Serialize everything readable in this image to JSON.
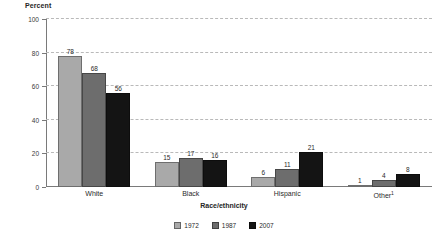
{
  "chart_data": {
    "type": "bar",
    "title": "",
    "subtitle": "",
    "xlabel": "Race/ethnicity",
    "ylabel": "Percent",
    "categories": [
      "White",
      "Black",
      "Hispanic",
      "Other"
    ],
    "category_footnotes": [
      "",
      "",
      "",
      "1"
    ],
    "series": [
      {
        "name": "1972",
        "color": "#a9a9a9",
        "values": [
          78,
          15,
          6,
          1
        ]
      },
      {
        "name": "1987",
        "color": "#6d6d6d",
        "values": [
          68,
          17,
          11,
          4
        ]
      },
      {
        "name": "2007",
        "color": "#141414",
        "values": [
          56,
          16,
          21,
          8
        ]
      }
    ],
    "ylim": [
      0,
      100
    ],
    "yticks": [
      0,
      20,
      40,
      60,
      80,
      100
    ],
    "ytick_labels": [
      "0",
      "20",
      "40",
      "60",
      "80",
      "100"
    ],
    "grid": "horizontal-dashed",
    "legend_position": "bottom-center"
  },
  "legend": {
    "items": [
      {
        "label": "1972"
      },
      {
        "label": "1987"
      },
      {
        "label": "2007"
      }
    ]
  }
}
